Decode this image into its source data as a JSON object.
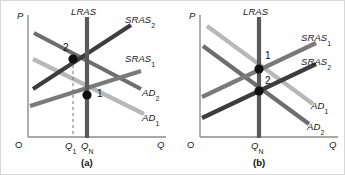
{
  "figure": {
    "type": "economics-ad-as-diagram",
    "background": "#ffffff",
    "border_color": "#d8d8d8"
  },
  "colors": {
    "axis": "#8c8c8c",
    "lras": "#5a5a5a",
    "sras_dark": "#3d3d3d",
    "sras_mid": "#7a7a7a",
    "ad_dark": "#6e6e6e",
    "ad_light": "#b8b8b8",
    "dashed": "#707070",
    "point": "#111111"
  },
  "panel_a": {
    "caption": "(a)",
    "y_axis_label": "P",
    "x_axis_label": "Q",
    "origin_label": "O",
    "lras_label": "LRAS",
    "curves": [
      {
        "name": "SRAS2",
        "label": "SRAS",
        "sub": "2",
        "kind": "sras",
        "shade": "dark"
      },
      {
        "name": "SRAS1",
        "label": "SRAS",
        "sub": "1",
        "kind": "sras",
        "shade": "mid"
      },
      {
        "name": "AD2",
        "label": "AD",
        "sub": "2",
        "kind": "ad",
        "shade": "dark"
      },
      {
        "name": "AD1",
        "label": "AD",
        "sub": "1",
        "kind": "ad",
        "shade": "light"
      }
    ],
    "points": [
      {
        "id": "2",
        "label": "2",
        "position": "upper-left",
        "on_lras": false
      },
      {
        "id": "1",
        "label": "1",
        "position": "lower-right",
        "on_lras": true
      }
    ],
    "x_ticks": [
      {
        "label": "Q",
        "sub": "1",
        "dashed_guide": true
      },
      {
        "label": "Q",
        "sub": "N",
        "dashed_guide": false
      }
    ]
  },
  "panel_b": {
    "caption": "(b)",
    "y_axis_label": "P",
    "x_axis_label": "Q",
    "origin_label": "O",
    "lras_label": "LRAS",
    "curves": [
      {
        "name": "SRAS1",
        "label": "SRAS",
        "sub": "1",
        "kind": "sras",
        "shade": "mid"
      },
      {
        "name": "SRAS2",
        "label": "SRAS",
        "sub": "2",
        "kind": "sras",
        "shade": "dark"
      },
      {
        "name": "AD1",
        "label": "AD",
        "sub": "1",
        "kind": "ad",
        "shade": "light"
      },
      {
        "name": "AD2",
        "label": "AD",
        "sub": "2",
        "kind": "ad",
        "shade": "dark"
      }
    ],
    "points": [
      {
        "id": "1",
        "label": "1",
        "position": "upper",
        "on_lras": true
      },
      {
        "id": "2",
        "label": "2",
        "position": "lower",
        "on_lras": true
      }
    ],
    "x_ticks": [
      {
        "label": "Q",
        "sub": "N",
        "dashed_guide": false
      }
    ]
  }
}
